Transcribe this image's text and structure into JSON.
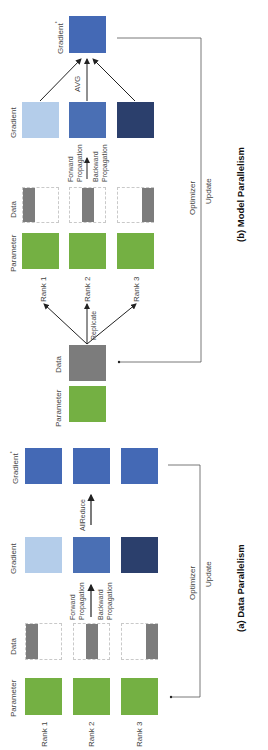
{
  "model_parallelism": {
    "caption": "(b) Model Parallelism",
    "labels": {
      "gradient_star": "Gradient",
      "gradient_star_sup": "*",
      "avg": "AVG",
      "gradient": "Gradient",
      "data": "Data",
      "parameter": "Parameter",
      "forward": "Forward",
      "forward_prop": "Propagation",
      "backward": "Backward",
      "backward_prop": "Propagation",
      "replicate": "Replicate",
      "optimizer": "Optimizer",
      "update": "Update",
      "source_data": "Data",
      "source_parameter": "Parameter"
    },
    "ranks": [
      "Rank 1",
      "Rank 2",
      "Rank 3"
    ]
  },
  "data_parallelism": {
    "caption": "(a) Data Parallelism",
    "labels": {
      "gradient_star": "Gradient",
      "gradient_star_sup": "*",
      "allreduce": "AllReduce",
      "gradient": "Gradient",
      "data": "Data",
      "parameter": "Parameter",
      "forward": "Forward",
      "forward_prop": "Propagation",
      "backward": "Backward",
      "backward_prop": "Propagation",
      "optimizer": "Optimizer",
      "update": "Update"
    },
    "ranks": [
      "Rank 1",
      "Rank 2",
      "Rank 3"
    ]
  },
  "colors": {
    "parameter": "#74b043",
    "data": "#7c7c7c",
    "gradient_rank1": "#b4cdea",
    "gradient_rank2": "#4a6fb4",
    "gradient_rank3": "#2b3f6c",
    "gradient_star": "#4469b5"
  }
}
